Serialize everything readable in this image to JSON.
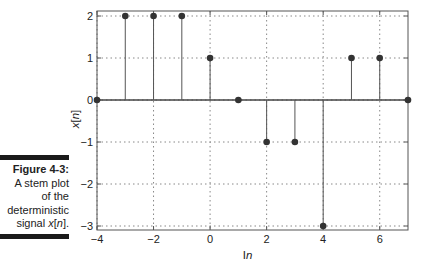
{
  "caption": {
    "figure_label": "Figure 4-3:",
    "lines": [
      "A stem plot",
      "of the",
      "deterministic",
      "signal x[n]."
    ]
  },
  "chart_data": {
    "type": "stem",
    "title": "",
    "xlabel": "Index – n",
    "ylabel": "x[n]",
    "xlim": [
      -4,
      7
    ],
    "ylim": [
      -3,
      2
    ],
    "xticks": [
      -4,
      -2,
      0,
      2,
      4,
      6
    ],
    "yticks": [
      -3,
      -2,
      -1,
      0,
      1,
      2
    ],
    "xtick_labels": [
      "−4",
      "−2",
      "0",
      "2",
      "4",
      "6"
    ],
    "ytick_labels": [
      "−3",
      "−2",
      "−1",
      "0",
      "1",
      "2"
    ],
    "grid": true,
    "legend": null,
    "x": [
      -4,
      -3,
      -2,
      -1,
      0,
      1,
      2,
      3,
      4,
      5,
      6,
      7
    ],
    "values": [
      0,
      2,
      2,
      2,
      1,
      0,
      -1,
      -1,
      -3,
      1,
      1,
      0
    ],
    "colors": {
      "stem": "#555555",
      "marker": "#333333",
      "grid": "#888888",
      "axes": "#555555"
    }
  }
}
